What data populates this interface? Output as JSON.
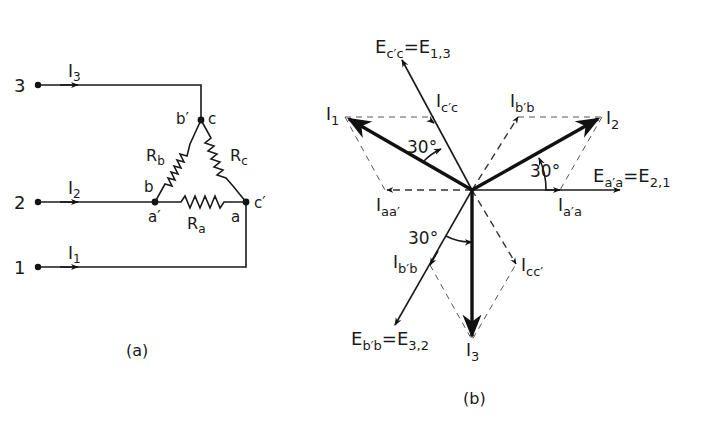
{
  "figure_a": {
    "caption": "(a)",
    "terminals": [
      {
        "label": "3",
        "current": "I",
        "current_sub": "3"
      },
      {
        "label": "2",
        "current": "I",
        "current_sub": "2"
      },
      {
        "label": "1",
        "current": "I",
        "current_sub": "1"
      }
    ],
    "nodes": {
      "top_left": "b′",
      "top_right": "c",
      "left_upper": "b",
      "left_lower": "a′",
      "right_lower": "a",
      "right_upper": "c′"
    },
    "resistors": [
      {
        "label": "R",
        "sub": "b"
      },
      {
        "label": "R",
        "sub": "c"
      },
      {
        "label": "R",
        "sub": "a"
      }
    ]
  },
  "figure_b": {
    "caption": "(b)",
    "phasors": {
      "Ecc": {
        "label": "E",
        "sub": "c′c",
        "eq": "=E",
        "eq_sub": "1,3"
      },
      "Icc_up": {
        "label": "I",
        "sub": "c′c"
      },
      "Ibb_up": {
        "label": "I",
        "sub": "b′b"
      },
      "I1": {
        "label": "I",
        "sub": "1"
      },
      "I2": {
        "label": "I",
        "sub": "2"
      },
      "Eaa": {
        "label": "E",
        "sub": "a′a",
        "eq": "=E",
        "eq_sub": "2,1"
      },
      "Iaa_left": {
        "label": "I",
        "sub": "aa′"
      },
      "Iaa_right": {
        "label": "I",
        "sub": "a′a"
      },
      "Ibb_down": {
        "label": "I",
        "sub": "b′b"
      },
      "Icc_down": {
        "label": "I",
        "sub": "cc′"
      },
      "Ebb": {
        "label": "E",
        "sub": "b′b",
        "eq": "=E",
        "eq_sub": "3,2"
      },
      "I3": {
        "label": "I",
        "sub": "3"
      }
    },
    "angles": [
      "30°",
      "30°",
      "30°"
    ]
  }
}
